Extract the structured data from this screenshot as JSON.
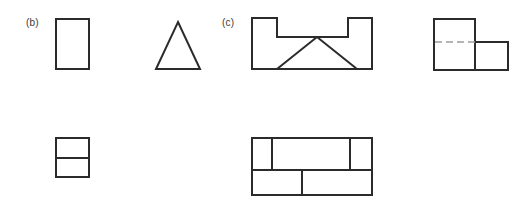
{
  "page": {
    "background_color": "#ffffff",
    "line_color": "#2b2b2b",
    "hidden_line_color": "#9d9d9d",
    "label_color": "#3a3a3a",
    "width": 528,
    "height": 219
  },
  "problems": [
    {
      "id": "b",
      "label": "(b)",
      "label_x": 26,
      "label_y": 22,
      "views": [
        {
          "name": "front-view-rectangle",
          "kind": "rectangle",
          "x": 55,
          "y": 18,
          "width": 35,
          "height": 52,
          "geometry": "M 1,1 L 34,1 L 34,51 L 1,51 Z"
        },
        {
          "name": "side-view-triangle",
          "kind": "triangle",
          "x": 155,
          "y": 21,
          "width": 46,
          "height": 49,
          "geometry": "M 23,1 L 45,48 L 1,48 Z"
        },
        {
          "name": "top-view-split-rectangle",
          "kind": "rectangle-split-horizontal",
          "x": 55,
          "y": 137,
          "width": 35,
          "height": 41,
          "geometry": "M 1,1 L 34,1 L 34,40 L 1,40 Z",
          "divider": "M 1,21 L 34,21"
        }
      ]
    },
    {
      "id": "c",
      "label": "(c)",
      "label_x": 222,
      "label_y": 22,
      "views": [
        {
          "name": "front-view-notched-block",
          "kind": "notched-outline-with-triangle",
          "x": 251,
          "y": 17,
          "width": 122,
          "height": 54,
          "geometry": "M 1,1 L 26,1 L 26,20 L 97,20 L 97,1 L 121,1 L 121,52 L 1,52 Z",
          "internal_lines": [
            "M 26,52 L 66,20",
            "M 66,20 L 106,52"
          ]
        },
        {
          "name": "side-view-l-shape",
          "kind": "l-shape-with-hidden-line",
          "x": 433,
          "y": 18,
          "width": 76,
          "height": 53,
          "geometry": "M 1,1 L 42,1 L 42,24 L 75,24 L 75,52 L 1,52 Z",
          "internal_lines": [
            "M 42,24 L 42,52"
          ],
          "hidden_lines": [
            "M 2,24 L 42,24"
          ]
        },
        {
          "name": "top-view-segmented-block",
          "kind": "segmented-rectangle",
          "x": 251,
          "y": 137,
          "width": 122,
          "height": 59,
          "geometry": "M 1,1 L 121,1 L 121,58 L 1,58 Z",
          "internal_lines": [
            "M 1,33 L 121,33",
            "M 21,1 L 21,33",
            "M 99,1 L 99,33",
            "M 51,33 L 51,58"
          ]
        }
      ]
    }
  ]
}
